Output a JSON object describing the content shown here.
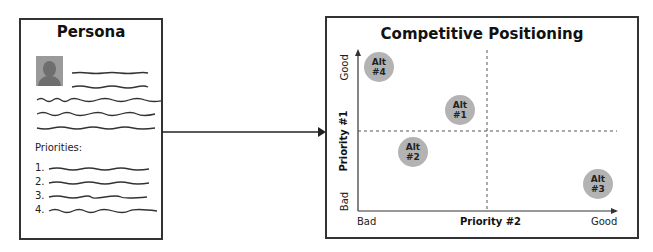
{
  "persona": {
    "title": "Persona",
    "avatar_icon": "person-silhouette-icon",
    "priorities_label": "Priorities:",
    "priority_numbers": [
      "1.",
      "2.",
      "3.",
      "4."
    ]
  },
  "connector": {
    "icon": "arrow-right-icon"
  },
  "positioning": {
    "title": "Competitive Positioning",
    "y_axis": {
      "title": "Priority #1",
      "low": "Bad",
      "high": "Good"
    },
    "x_axis": {
      "title": "Priority #2",
      "low": "Bad",
      "high": "Good"
    },
    "alternatives": [
      {
        "line1": "Alt",
        "line2": "#4",
        "x": 379,
        "y": 67
      },
      {
        "line1": "Alt",
        "line2": "#1",
        "x": 460,
        "y": 110
      },
      {
        "line1": "Alt",
        "line2": "#2",
        "x": 413,
        "y": 152
      },
      {
        "line1": "Alt",
        "line2": "#3",
        "x": 598,
        "y": 184
      }
    ],
    "circle_color": "#b3b3b3"
  }
}
